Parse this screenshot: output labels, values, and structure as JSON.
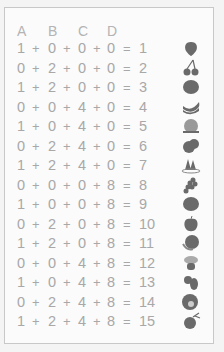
{
  "header": [
    "A",
    "B",
    "C",
    "D"
  ],
  "plus": "+",
  "equals": "=",
  "colors": {
    "text": "#a8a8a8",
    "fruit": "#6a6a6a",
    "border": "#c8c8c8"
  },
  "rows": [
    {
      "a": "1",
      "b": "0",
      "c": "0",
      "d": "0",
      "sum": "1",
      "fruit": "strawberry-icon"
    },
    {
      "a": "0",
      "b": "2",
      "c": "0",
      "d": "0",
      "sum": "2",
      "fruit": "cherries-icon"
    },
    {
      "a": "1",
      "b": "2",
      "c": "0",
      "d": "0",
      "sum": "3",
      "fruit": "orange-icon"
    },
    {
      "a": "0",
      "b": "0",
      "c": "4",
      "d": "0",
      "sum": "4",
      "fruit": "bananas-icon"
    },
    {
      "a": "1",
      "b": "0",
      "c": "4",
      "d": "0",
      "sum": "5",
      "fruit": "peach-icon"
    },
    {
      "a": "0",
      "b": "2",
      "c": "4",
      "d": "0",
      "sum": "6",
      "fruit": "plums-icon"
    },
    {
      "a": "1",
      "b": "2",
      "c": "4",
      "d": "0",
      "sum": "7",
      "fruit": "watermelon-slices-icon"
    },
    {
      "a": "0",
      "b": "0",
      "c": "0",
      "d": "8",
      "sum": "8",
      "fruit": "grapes-icon"
    },
    {
      "a": "1",
      "b": "0",
      "c": "0",
      "d": "8",
      "sum": "9",
      "fruit": "orange-icon"
    },
    {
      "a": "0",
      "b": "2",
      "c": "0",
      "d": "8",
      "sum": "10",
      "fruit": "apple-icon"
    },
    {
      "a": "1",
      "b": "2",
      "c": "0",
      "d": "8",
      "sum": "11",
      "fruit": "melon-icon"
    },
    {
      "a": "0",
      "b": "0",
      "c": "4",
      "d": "8",
      "sum": "12",
      "fruit": "guava-icon"
    },
    {
      "a": "1",
      "b": "0",
      "c": "4",
      "d": "8",
      "sum": "13",
      "fruit": "mango-icon"
    },
    {
      "a": "0",
      "b": "2",
      "c": "4",
      "d": "8",
      "sum": "14",
      "fruit": "passion-fruit-icon"
    },
    {
      "a": "1",
      "b": "2",
      "c": "4",
      "d": "8",
      "sum": "15",
      "fruit": "eggplant-icon"
    }
  ]
}
